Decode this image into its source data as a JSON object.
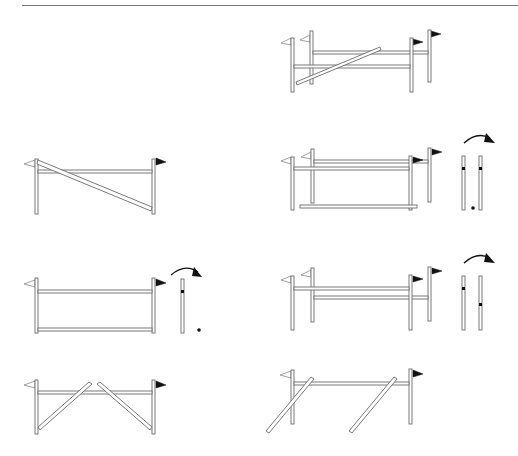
{
  "colors": {
    "background": "#ffffff",
    "outline": "#6b6b6b",
    "flag_left": "#ffffff",
    "flag_right": "#111111",
    "marker": "#111111"
  },
  "figure": {
    "title": "",
    "panels": [
      {
        "id": "a",
        "description": "Oxer with knocked rail lying diagonally",
        "position": "top-right"
      },
      {
        "id": "b",
        "description": "Vertical with rail fallen diagonally from left top to right bottom",
        "position": "mid-left"
      },
      {
        "id": "c",
        "description": "Oxer with rail fallen on ground, wing standard rotation with cup markers",
        "position": "mid-right"
      },
      {
        "id": "d",
        "description": "Vertical with top and ground rail, standard rotation with cup marker",
        "position": "third-left"
      },
      {
        "id": "e",
        "description": "Oxer with offset rails, standard rotation with staggered cup markers",
        "position": "third-right"
      },
      {
        "id": "f",
        "description": "Vertical with two rails fallen forming V shape",
        "position": "bottom-left"
      },
      {
        "id": "g",
        "description": "Vertical with two rails leaning diagonally outward",
        "position": "bottom-right"
      }
    ],
    "icons": {
      "left_flag": "white-flag-icon",
      "right_flag": "black-flag-icon",
      "rotate": "curved-arrow-icon",
      "cup": "cup-marker-icon"
    }
  }
}
